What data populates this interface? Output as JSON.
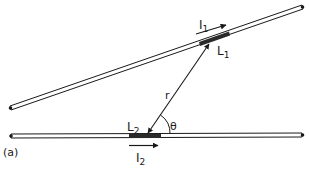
{
  "figure": {
    "panel_label": "(a)",
    "colors": {
      "ink": "#1a1a1a",
      "background": "#ffffff",
      "segment": "#2a2a2a"
    }
  },
  "wire1": {
    "start": [
      10,
      108
    ],
    "end": [
      302,
      7
    ],
    "current_label": "I",
    "current_sub": "1",
    "segment_label": "L",
    "segment_sub": "1"
  },
  "wire2": {
    "start": [
      11,
      136
    ],
    "end": [
      302,
      135
    ],
    "current_label": "I",
    "current_sub": "2",
    "segment_label": "L",
    "segment_sub": "2"
  },
  "separation": {
    "label": "r",
    "angle_label": "θ"
  }
}
